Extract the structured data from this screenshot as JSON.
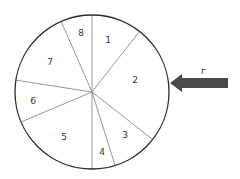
{
  "diagram": {
    "circle": {
      "cx": 92,
      "cy": 92,
      "r": 77,
      "stroke": "#2b2b2b"
    },
    "divider_color": "#8a8a8a",
    "sectors": [
      {
        "label": "1",
        "x": 108,
        "y": 43
      },
      {
        "label": "2",
        "x": 135,
        "y": 83
      },
      {
        "label": "3",
        "x": 125,
        "y": 138
      },
      {
        "label": "4",
        "x": 102,
        "y": 155
      },
      {
        "label": "5",
        "x": 64,
        "y": 140
      },
      {
        "label": "6",
        "x": 33,
        "y": 104
      },
      {
        "label": "7",
        "x": 50,
        "y": 65
      },
      {
        "label": "8",
        "x": 81,
        "y": 36
      }
    ],
    "arrow": {
      "label": "r",
      "color": "#4a4a4a"
    }
  }
}
